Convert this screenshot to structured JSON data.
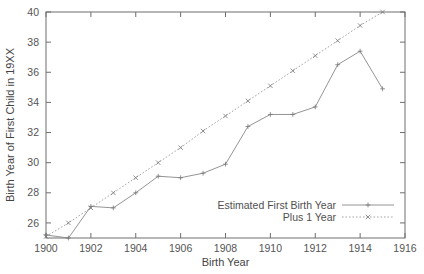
{
  "chart_data": {
    "type": "line",
    "title": "",
    "xlabel": "Birth Year",
    "ylabel": "Birth Year of First Child in 19XX",
    "xlim": [
      1900,
      1916
    ],
    "ylim": [
      25,
      40
    ],
    "xticks": [
      1900,
      1902,
      1904,
      1906,
      1908,
      1910,
      1912,
      1914,
      1916
    ],
    "xticklabels": [
      "1900",
      "1902",
      "1904",
      "1906",
      "1908",
      "1910",
      "1912",
      "1914",
      "1916"
    ],
    "yticks": [
      26,
      28,
      30,
      32,
      34,
      36,
      38,
      40
    ],
    "yticklabels": [
      "26",
      "28",
      "30",
      "32",
      "34",
      "36",
      "38",
      "40"
    ],
    "grid": false,
    "legend_position": "bottom-right",
    "x": [
      1900,
      1901,
      1902,
      1903,
      1904,
      1905,
      1906,
      1907,
      1908,
      1909,
      1910,
      1911,
      1912,
      1913,
      1914,
      1915
    ],
    "series": [
      {
        "name": "Estimated First Birth Year",
        "style": "solid",
        "marker": "plus",
        "color": "#888888",
        "values": [
          25.2,
          25.0,
          27.1,
          27.0,
          28.0,
          29.1,
          29.0,
          29.3,
          29.9,
          32.4,
          33.2,
          33.2,
          33.7,
          36.5,
          37.4,
          34.9
        ]
      },
      {
        "name": "Plus 1 Year",
        "style": "dotted",
        "marker": "cross",
        "color": "#9a9a9a",
        "values": [
          25.1,
          26.0,
          27.0,
          28.0,
          29.0,
          30.0,
          31.0,
          32.1,
          33.1,
          34.1,
          35.1,
          36.1,
          37.1,
          38.1,
          39.1,
          40.0
        ]
      }
    ]
  },
  "axis": {
    "x_title": "Birth Year",
    "y_title": "Birth Year of First Child in 19XX"
  },
  "legend": {
    "entries": [
      {
        "label": "Estimated First Birth Year"
      },
      {
        "label": "Plus 1 Year"
      }
    ]
  }
}
